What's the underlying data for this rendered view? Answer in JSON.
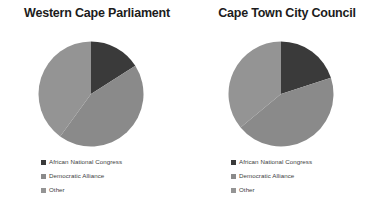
{
  "figure": {
    "background": "#ffffff",
    "width": 381,
    "height": 213
  },
  "palette": {
    "anc": "#3a3a3a",
    "da": "#8a8a8a",
    "other": "#949494",
    "title_text": "#1c1c1c",
    "legend_text": "#3d3d3d"
  },
  "charts": [
    {
      "title": "Western Cape Parliament",
      "legend": [
        {
          "label": "African National Congress",
          "color": "#3a3a3a"
        },
        {
          "label": "Democratic Alliance",
          "color": "#8a8a8a"
        },
        {
          "label": "Other",
          "color": "#949494"
        }
      ]
    },
    {
      "title": "Cape Town City Council",
      "legend": [
        {
          "label": "African National Congress",
          "color": "#3a3a3a"
        },
        {
          "label": "Democratic Alliance",
          "color": "#8a8a8a"
        },
        {
          "label": "Other",
          "color": "#949494"
        }
      ]
    }
  ],
  "chart_data": [
    {
      "type": "pie",
      "title": "Western Cape Parliament",
      "categories": [
        "African National Congress",
        "Democratic Alliance",
        "Other"
      ],
      "values": [
        16,
        44,
        40
      ],
      "colors": [
        "#3a3a3a",
        "#8a8a8a",
        "#949494"
      ],
      "start_angle_deg": 0,
      "direction": "clockwise",
      "legend_position": "bottom-left",
      "radius_px": 53,
      "center_px": [
        91,
        94
      ]
    },
    {
      "type": "pie",
      "title": "Cape Town City Council",
      "categories": [
        "African National Congress",
        "Democratic Alliance",
        "Other"
      ],
      "values": [
        20,
        44,
        36
      ],
      "colors": [
        "#3a3a3a",
        "#8a8a8a",
        "#949494"
      ],
      "start_angle_deg": 0,
      "direction": "clockwise",
      "legend_position": "bottom-left",
      "radius_px": 53,
      "center_px": [
        279,
        94
      ]
    }
  ]
}
